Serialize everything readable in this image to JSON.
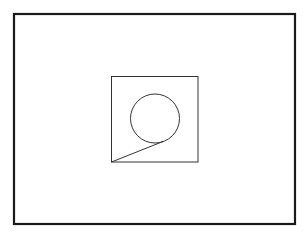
{
  "diagram": {
    "shapes": [
      {
        "id": "outer-frame",
        "type": "rectangle",
        "stroke": "#1a1a1a"
      },
      {
        "id": "inner-square",
        "type": "rectangle",
        "stroke": "#333333"
      },
      {
        "id": "circle",
        "type": "circle",
        "stroke": "#333333"
      },
      {
        "id": "connector-line",
        "type": "line",
        "stroke": "#333333",
        "from": "inner-square bottom-left corner",
        "to": "circle lower-right edge"
      }
    ],
    "background": "#ffffff"
  }
}
